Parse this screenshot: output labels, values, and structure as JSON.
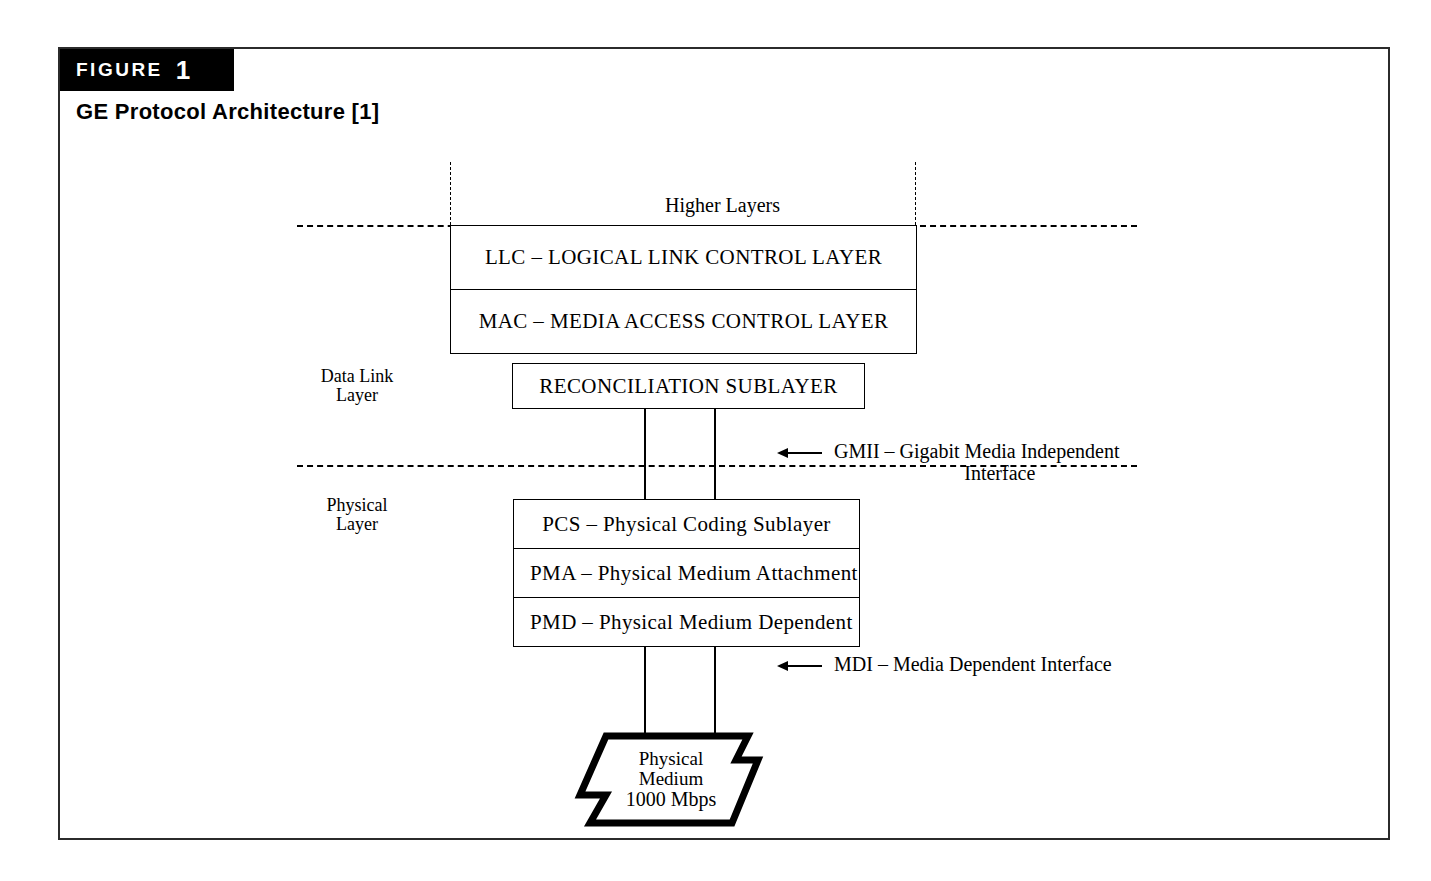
{
  "figure": {
    "badge_word": "FIGURE",
    "badge_number": "1",
    "caption": "GE Protocol Architecture [1]"
  },
  "diagram": {
    "higher_layers_label": "Higher Layers",
    "side_labels": {
      "data_link": "Data Link\nLayer",
      "physical": "Physical\nLayer"
    },
    "data_link_boxes": [
      {
        "text": "LLC – LOGICAL LINK CONTROL LAYER"
      },
      {
        "text": "MAC – MEDIA ACCESS CONTROL LAYER"
      },
      {
        "text": "RECONCILIATION SUBLAYER"
      }
    ],
    "physical_boxes": [
      {
        "text": "PCS – Physical Coding Sublayer"
      },
      {
        "text": "PMA – Physical Medium Attachment"
      },
      {
        "text": "PMD – Physical Medium Dependent"
      }
    ],
    "interfaces": [
      {
        "line1": "GMII  – Gigabit Media Independent",
        "line2": "Interface"
      },
      {
        "line1": "MDI – Media Dependent Interface",
        "line2": ""
      }
    ],
    "physical_medium": {
      "line1": "Physical",
      "line2": "Medium",
      "line3": "1000 Mbps"
    }
  },
  "colors": {
    "ink": "#000000",
    "frame": "#2b2b2b",
    "page": "#ffffff",
    "badge_background": "#000000",
    "badge_text": "#ffffff"
  }
}
